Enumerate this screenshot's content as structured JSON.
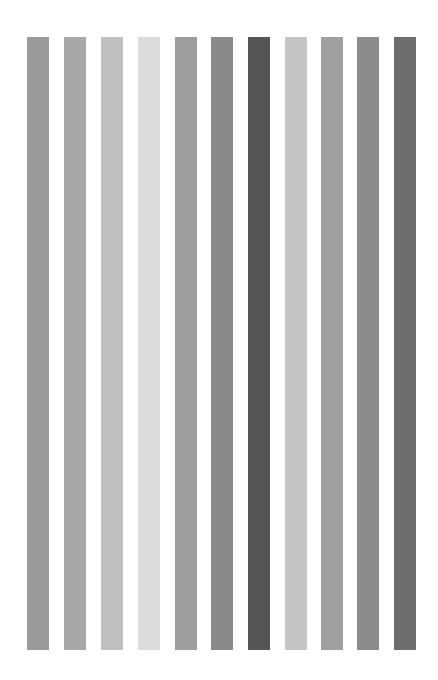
{
  "stripes": [
    {
      "x": 27,
      "color": "#9a9a9a"
    },
    {
      "x": 64,
      "color": "#a8a8a8"
    },
    {
      "x": 101,
      "color": "#bfbfbf"
    },
    {
      "x": 138,
      "color": "#dcdcdc"
    },
    {
      "x": 175,
      "color": "#9e9e9e"
    },
    {
      "x": 211,
      "color": "#8a8a8a"
    },
    {
      "x": 248,
      "color": "#555555"
    },
    {
      "x": 285,
      "color": "#c4c4c4"
    },
    {
      "x": 321,
      "color": "#a0a0a0"
    },
    {
      "x": 357,
      "color": "#8c8c8c"
    },
    {
      "x": 394,
      "color": "#6e6e6e"
    }
  ]
}
